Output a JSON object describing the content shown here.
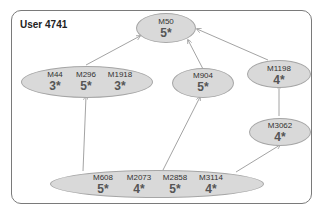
{
  "title": "User 4741",
  "nodes": {
    "m50": {
      "movies": [
        "M50"
      ],
      "ratings": [
        "5*"
      ]
    },
    "g1": {
      "movies": [
        "M44",
        "M296",
        "M1918"
      ],
      "ratings": [
        "3*",
        "5*",
        "3*"
      ]
    },
    "m904": {
      "movies": [
        "M904"
      ],
      "ratings": [
        "5*"
      ]
    },
    "m1198": {
      "movies": [
        "M1198"
      ],
      "ratings": [
        "4*"
      ]
    },
    "m3062": {
      "movies": [
        "M3062"
      ],
      "ratings": [
        "4*"
      ]
    },
    "g2": {
      "movies": [
        "M608",
        "M2073",
        "M2858",
        "M3114"
      ],
      "ratings": [
        "5*",
        "4*",
        "5*",
        "4*"
      ]
    }
  },
  "edges": [
    {
      "from": "g1",
      "to": "m50"
    },
    {
      "from": "m904",
      "to": "m50"
    },
    {
      "from": "m1198",
      "to": "m50"
    },
    {
      "from": "g2",
      "to": "g1"
    },
    {
      "from": "g2",
      "to": "m904"
    },
    {
      "from": "g2",
      "to": "m3062"
    },
    {
      "from": "m3062",
      "to": "m1198"
    }
  ],
  "colors": {
    "node_fill": "#d9d9d9",
    "node_border": "#a6a6a6",
    "edge": "#8c8c8c",
    "frame": "#7a7a7a"
  }
}
